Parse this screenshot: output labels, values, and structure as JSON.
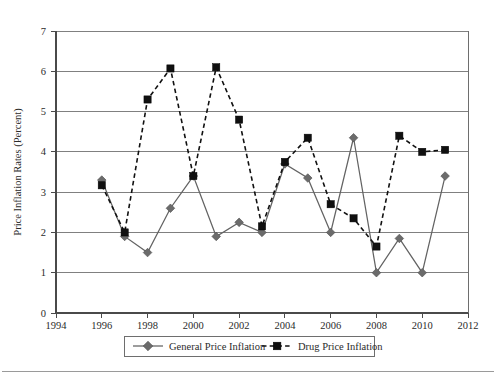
{
  "chart_data": {
    "type": "line",
    "title": "",
    "xlabel": "Year",
    "ylabel": "Price Inflation Rates (Percent)",
    "xlim": [
      1994,
      2012
    ],
    "ylim": [
      0,
      7
    ],
    "xticks": [
      1994,
      1996,
      1998,
      2000,
      2002,
      2004,
      2006,
      2008,
      2010,
      2012
    ],
    "yticks": [
      0,
      1,
      2,
      3,
      4,
      5,
      6,
      7
    ],
    "grid": "horizontal",
    "legend_position": "bottom",
    "x": [
      1996,
      1997,
      1998,
      1999,
      2000,
      2001,
      2002,
      2003,
      2004,
      2005,
      2006,
      2007,
      2008,
      2009,
      2010,
      2011
    ],
    "series": [
      {
        "name": "General Price Inflation",
        "marker": "diamond",
        "linestyle": "solid",
        "color": "#636363",
        "values": [
          3.3,
          1.9,
          1.5,
          2.6,
          3.4,
          1.9,
          2.25,
          2.0,
          3.7,
          3.35,
          2.0,
          4.35,
          1.0,
          1.85,
          1.0,
          3.4
        ]
      },
      {
        "name": "Drug Price Inflation",
        "marker": "square",
        "linestyle": "dashed",
        "color": "#101010",
        "values": [
          3.17,
          2.0,
          5.3,
          6.07,
          3.4,
          6.1,
          4.8,
          2.15,
          3.75,
          4.35,
          2.7,
          2.35,
          1.65,
          4.4,
          4.0,
          4.05
        ]
      }
    ]
  },
  "axes": {
    "y_title": "Price Inflation Rates (Percent)",
    "x_title": "Year",
    "y_tick_labels": [
      "0",
      "1",
      "2",
      "3",
      "4",
      "5",
      "6",
      "7"
    ],
    "x_tick_labels": [
      "1994",
      "1996",
      "1998",
      "2000",
      "2002",
      "2004",
      "2006",
      "2008",
      "2010",
      "2012"
    ]
  },
  "legend": {
    "items": [
      {
        "label": "General Price Inflation",
        "marker": "diamond-marker-icon",
        "style": "solid"
      },
      {
        "label": "Drug Price Inflation",
        "marker": "square-marker-icon",
        "style": "dashed"
      }
    ]
  }
}
